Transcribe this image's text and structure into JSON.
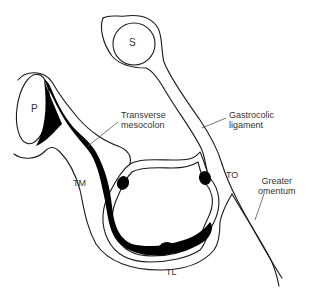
{
  "diagram": {
    "type": "anatomical cross-section",
    "colors": {
      "line": "#1a1a1a",
      "fill_dark": "#000000",
      "background": "#ffffff",
      "text": "#333333"
    },
    "organs": {
      "stomach": "S",
      "pancreas": "P"
    },
    "taenia": {
      "mesocolica": "TM",
      "omentalis": "TO",
      "libera": "TL"
    },
    "labels": {
      "transverse_mesocolon_1": "Transverse",
      "transverse_mesocolon_2": "mesocolon",
      "gastrocolic_1": "Gastrocolic",
      "gastrocolic_2": "ligament",
      "greater_omentum_1": "Greater",
      "greater_omentum_2": "omentum"
    }
  }
}
